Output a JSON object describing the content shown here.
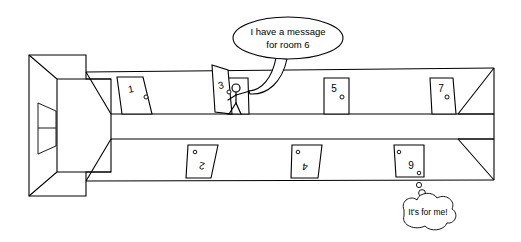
{
  "scene": {
    "title": "Corridor perspective cartoon",
    "description": "Line drawing of a hallway in perspective with numbered doors"
  },
  "speech_bubble": {
    "name": "messenger-speech-bubble",
    "line1": "I have a message",
    "line2": "for room 6",
    "shape": "oval",
    "cx": 288,
    "cy": 38,
    "rx": 55,
    "ry": 21
  },
  "thought_bubble": {
    "name": "room-six-thought-bubble",
    "text": "It's for me!",
    "shape": "cloud",
    "cx": 427,
    "cy": 215,
    "rx": 32,
    "ry": 14
  },
  "doors": {
    "upper_wall": [
      {
        "label": "1",
        "x": 131,
        "y": 88,
        "knob_x": 146,
        "knob_y": 94,
        "style": "parallelogram-left"
      },
      {
        "label": "3",
        "x": 222,
        "y": 82,
        "knob_x": 231,
        "knob_y": 90,
        "style": "open-door"
      },
      {
        "label": "5",
        "x": 334,
        "y": 88,
        "knob_x": 341,
        "knob_y": 95,
        "style": "rectangle"
      },
      {
        "label": "7",
        "x": 440,
        "y": 88,
        "knob_x": 446,
        "knob_y": 95,
        "style": "parallelogram-right"
      }
    ],
    "lower_wall": [
      {
        "label": "2",
        "x": 202,
        "y": 164,
        "knob_x": 196,
        "knob_y": 155,
        "style": "parallelogram-inverted"
      },
      {
        "label": "4",
        "x": 306,
        "y": 166,
        "knob_x": 299,
        "knob_y": 155,
        "style": "parallelogram-inverted"
      },
      {
        "label": "9",
        "x": 411,
        "y": 168,
        "knob_x": 400,
        "knob_y": 153,
        "style": "rectangle-inverted"
      }
    ]
  },
  "figure": {
    "name": "stick-figure-messenger",
    "location": "doorway-3",
    "head_x": 235,
    "head_y": 88
  },
  "colors": {
    "line": "#000000",
    "background": "#ffffff"
  }
}
